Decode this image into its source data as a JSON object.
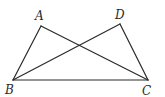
{
  "figure": {
    "type": "geometry",
    "points": {
      "A": {
        "x": 41,
        "y": 26,
        "label": "A",
        "lx": 35,
        "ly": 20
      },
      "D": {
        "x": 120,
        "y": 24,
        "label": "D",
        "lx": 115,
        "ly": 19
      },
      "B": {
        "x": 13,
        "y": 80,
        "label": "B",
        "lx": 5,
        "ly": 94
      },
      "C": {
        "x": 148,
        "y": 80,
        "label": "C",
        "lx": 142,
        "ly": 95
      }
    },
    "segments": [
      [
        "A",
        "B"
      ],
      [
        "A",
        "C"
      ],
      [
        "D",
        "B"
      ],
      [
        "D",
        "C"
      ],
      [
        "B",
        "C"
      ]
    ],
    "stroke_color": "#2a2a2a",
    "background": "#ffffff"
  }
}
